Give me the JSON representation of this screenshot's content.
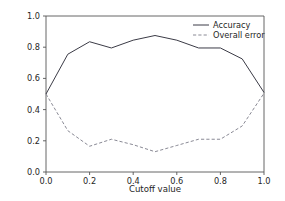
{
  "chart_data": {
    "type": "line",
    "title": "",
    "xlabel": "Cutoff value",
    "ylabel": "",
    "xlim": [
      0.0,
      1.0
    ],
    "ylim": [
      0.0,
      1.0
    ],
    "grid": false,
    "legend_position": "upper right",
    "x": [
      0.0,
      0.1,
      0.2,
      0.3,
      0.4,
      0.5,
      0.6,
      0.7,
      0.8,
      0.9,
      1.0
    ],
    "xticks": [
      "0.0",
      "0.2",
      "0.4",
      "0.6",
      "0.8",
      "1.0"
    ],
    "xtick_values": [
      0.0,
      0.2,
      0.4,
      0.6,
      0.8,
      1.0
    ],
    "yticks": [
      "0.0",
      "0.2",
      "0.4",
      "0.6",
      "0.8",
      "1.0"
    ],
    "ytick_values": [
      0.0,
      0.2,
      0.4,
      0.6,
      0.8,
      1.0
    ],
    "series": [
      {
        "name": "Accuracy",
        "style": "solid",
        "color": "#3b3b46",
        "values": [
          0.5,
          0.755,
          0.835,
          0.795,
          0.845,
          0.875,
          0.845,
          0.795,
          0.795,
          0.725,
          0.51
        ]
      },
      {
        "name": "Overall error",
        "style": "dashed",
        "color": "#8a8a95",
        "values": [
          0.5,
          0.265,
          0.165,
          0.21,
          0.175,
          0.13,
          0.17,
          0.21,
          0.21,
          0.295,
          0.505
        ]
      }
    ]
  },
  "legend": {
    "entries": [
      {
        "label": "Accuracy"
      },
      {
        "label": "Overall error"
      }
    ]
  },
  "axes": {
    "xlabel": "Cutoff value"
  }
}
